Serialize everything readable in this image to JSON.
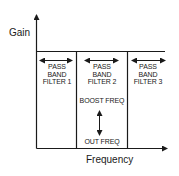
{
  "diagram": {
    "y_axis_label": "Gain",
    "x_axis_label": "Frequency",
    "bands": [
      {
        "line1": "PASS",
        "line2": "BAND",
        "line3": "FILTER 1"
      },
      {
        "line1": "PASS",
        "line2": "BAND",
        "line3": "FILTER 2"
      },
      {
        "line1": "PASS",
        "line2": "BAND",
        "line3": "FILTER 3"
      }
    ],
    "boost_label": "BOOST FREQ",
    "cut_label": "OUT FREQ",
    "colors": {
      "stroke": "#1a1a1a",
      "background": "#ffffff"
    }
  }
}
